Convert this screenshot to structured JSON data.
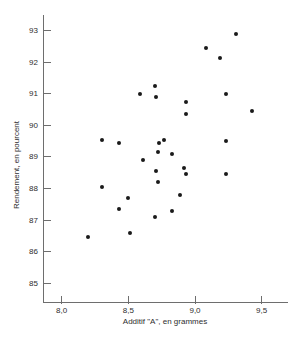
{
  "figure": {
    "background": "#ffffff",
    "dot_color": "#1a1a1a",
    "axis_color": "#6e6e6e",
    "text_color": "#2e2e2e"
  },
  "chart_data": {
    "type": "scatter",
    "title": "",
    "xlabel": "Additif \"A\", en grammes",
    "ylabel": "Rendement, en pourcent",
    "xlim": [
      7.86,
      9.69
    ],
    "ylim": [
      84.4,
      93.5
    ],
    "grid": false,
    "legend": null,
    "x_ticks": {
      "values": [
        8.0,
        8.5,
        9.0,
        9.5
      ],
      "labels": [
        "8,0",
        "8,5",
        "9,0",
        "9,5"
      ]
    },
    "y_ticks": {
      "values": [
        85,
        86,
        87,
        88,
        89,
        90,
        91,
        92,
        93
      ],
      "labels": [
        "85",
        "86",
        "87",
        "88",
        "89",
        "90",
        "91",
        "92",
        "93"
      ]
    },
    "points": [
      [
        8.2,
        86.45
      ],
      [
        8.3,
        88.05
      ],
      [
        8.3,
        89.55
      ],
      [
        8.43,
        87.35
      ],
      [
        8.43,
        89.45
      ],
      [
        8.5,
        87.7
      ],
      [
        8.51,
        86.6
      ],
      [
        8.59,
        91.0
      ],
      [
        8.61,
        88.9
      ],
      [
        8.7,
        87.1
      ],
      [
        8.7,
        91.25
      ],
      [
        8.71,
        88.55
      ],
      [
        8.71,
        90.9
      ],
      [
        8.72,
        88.2
      ],
      [
        8.72,
        89.15
      ],
      [
        8.73,
        89.45
      ],
      [
        8.77,
        89.55
      ],
      [
        8.83,
        87.3
      ],
      [
        8.83,
        89.1
      ],
      [
        8.89,
        87.8
      ],
      [
        8.92,
        88.65
      ],
      [
        8.93,
        88.45
      ],
      [
        8.93,
        90.35
      ],
      [
        8.93,
        90.75
      ],
      [
        9.08,
        92.45
      ],
      [
        9.19,
        92.15
      ],
      [
        9.23,
        88.45
      ],
      [
        9.23,
        89.5
      ],
      [
        9.23,
        91.0
      ],
      [
        9.31,
        92.9
      ],
      [
        9.43,
        90.45
      ]
    ]
  }
}
